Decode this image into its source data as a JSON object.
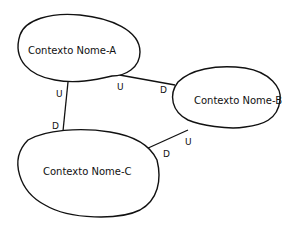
{
  "diagram": {
    "type": "context-map",
    "contexts": [
      {
        "id": "A",
        "label": "Contexto Nome-A"
      },
      {
        "id": "B",
        "label": "Contexto Nome-B"
      },
      {
        "id": "C",
        "label": "Contexto Nome-C"
      }
    ],
    "relationships": [
      {
        "from": "A",
        "to": "B",
        "from_label": "U",
        "to_label": "D"
      },
      {
        "from": "A",
        "to": "C",
        "from_label": "U",
        "to_label": "D"
      },
      {
        "from": "B",
        "to": "C",
        "from_label": "U",
        "to_label": "D"
      }
    ],
    "colors": {
      "stroke": "#111111",
      "background": "#ffffff"
    }
  }
}
